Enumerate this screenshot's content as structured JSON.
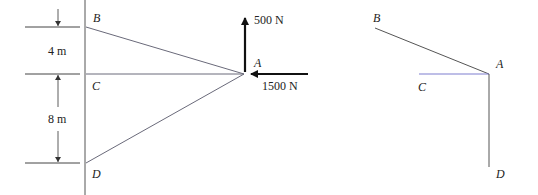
{
  "left_figure": {
    "points": {
      "B": {
        "label": "B"
      },
      "C": {
        "label": "C"
      },
      "D": {
        "label": "D"
      },
      "A": {
        "label": "A"
      }
    },
    "dimensions": [
      {
        "label": "4 m",
        "between": [
          "B",
          "C"
        ]
      },
      {
        "label": "8 m",
        "between": [
          "C",
          "D"
        ]
      }
    ],
    "forces": [
      {
        "label": "500 N",
        "direction": "up",
        "at": "A"
      },
      {
        "label": "1500 N",
        "direction": "left",
        "at": "A"
      }
    ]
  },
  "right_figure": {
    "points": {
      "B": {
        "label": "B"
      },
      "C": {
        "label": "C"
      },
      "A": {
        "label": "A"
      },
      "D": {
        "label": "D"
      }
    }
  },
  "colors": {
    "line": "#555555",
    "member": "#6a6a7a",
    "arrow": "#111111",
    "highlight_c": "#7f7fd0"
  }
}
